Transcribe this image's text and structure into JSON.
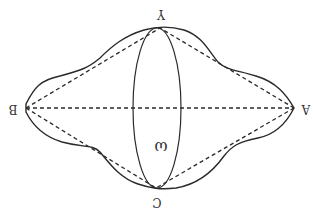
{
  "diagram": {
    "orientation": "rotated 180 degrees",
    "labels": {
      "left": "B",
      "right": "A",
      "top": "Y",
      "bottom": "C",
      "center": "ω"
    },
    "colors": {
      "stroke": "#2a2a2a",
      "background": "#ffffff"
    }
  }
}
